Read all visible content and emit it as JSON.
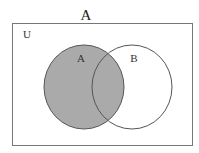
{
  "diagram": {
    "type": "venn",
    "title": "A",
    "universe_label": "U",
    "sets": [
      {
        "id": "A",
        "label": "A",
        "shaded": true
      },
      {
        "id": "B",
        "label": "B",
        "shaded": false
      }
    ],
    "shaded_region": "A",
    "colors": {
      "shade": "#aaaaaa",
      "circle_stroke": "#555555",
      "universe_stroke": "#777777",
      "background": "#ffffff"
    }
  }
}
